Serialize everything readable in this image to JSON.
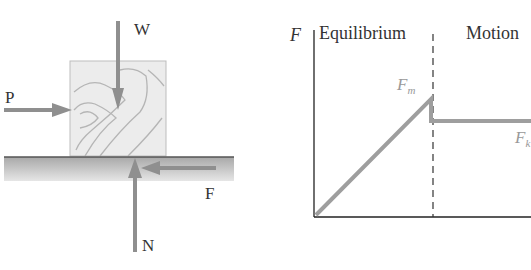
{
  "fbd": {
    "labels": {
      "weight": "W",
      "push": "P",
      "friction": "F",
      "normal": "N"
    },
    "colors": {
      "arrow": "#8f8f8f",
      "block": "#ebebeb",
      "grain": "#b4b4b4",
      "ground": "#c8c8c8"
    }
  },
  "graph": {
    "y_axis_label": "F",
    "region_left": "Equilibrium",
    "region_right": "Motion",
    "peak_label": "F",
    "peak_sub": "m",
    "kinetic_label": "F",
    "kinetic_sub": "k",
    "colors": {
      "line": "#9e9e9e",
      "axis": "#222222"
    }
  }
}
